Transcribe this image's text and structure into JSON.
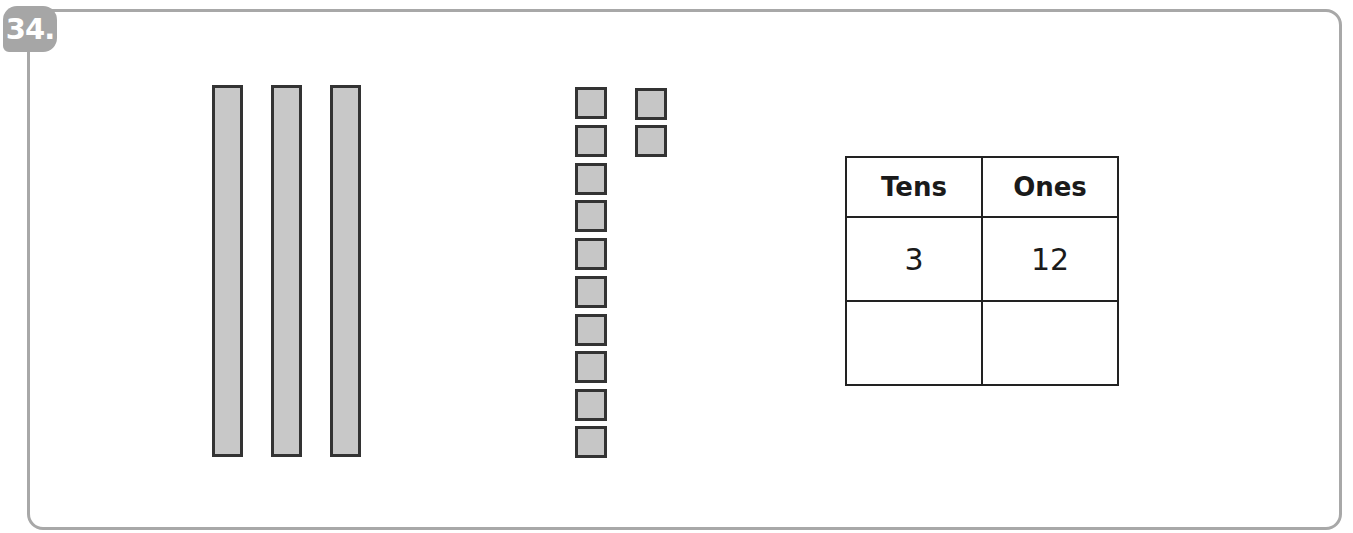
{
  "problem": {
    "number_label": "34.",
    "model": {
      "tens_rods": 3,
      "unit_cubes": 12,
      "unit_cube_columns": [
        10,
        2
      ]
    },
    "table": {
      "headers": [
        "Tens",
        "Ones"
      ],
      "rows": [
        [
          "3",
          "12"
        ],
        [
          "",
          ""
        ]
      ]
    },
    "colors": {
      "block_fill": "#c6c6c6",
      "block_outline": "#333333",
      "frame": "#a8a8a8",
      "badge": "#a6a6a6"
    }
  }
}
